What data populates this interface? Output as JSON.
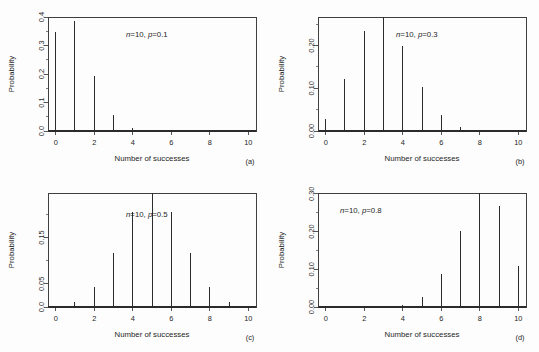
{
  "figure": {
    "background_color": "#fdfdfd",
    "ink_color": "#2b2b2b",
    "width": 539,
    "height": 352
  },
  "chart_data": [
    {
      "type": "bar",
      "panel_label": "(a)",
      "title": "",
      "annotation": "n=10, p=0.1",
      "annotation_parts": {
        "n_label": "n",
        "n_value": "=10,",
        "p_label": "p",
        "p_value": "=0.1"
      },
      "xlabel": "Number of successes",
      "ylabel": "Probability",
      "categories": [
        0,
        1,
        2,
        3,
        4,
        5,
        6,
        7,
        8,
        9,
        10
      ],
      "values": [
        0.3487,
        0.3874,
        0.1937,
        0.0574,
        0.0112,
        0.0015,
        0.0001,
        0.0,
        0.0,
        0.0,
        0.0
      ],
      "xlim": [
        -0.4,
        10.4
      ],
      "ylim": [
        0,
        0.4
      ],
      "xticks": [
        0,
        2,
        4,
        6,
        8,
        10
      ],
      "xticklabels": [
        "0",
        "2",
        "4",
        "6",
        "8",
        "10"
      ],
      "yticks": [
        0.0,
        0.1,
        0.2,
        0.3,
        0.4
      ],
      "yticklabels": [
        "0.0",
        "0.1",
        "0.2",
        "0.3",
        "0.4"
      ],
      "yminorticks": [
        0.05,
        0.15,
        0.25,
        0.35
      ],
      "grid": false,
      "legend": "none"
    },
    {
      "type": "bar",
      "panel_label": "(b)",
      "title": "",
      "annotation": "n=10, p=0.3",
      "annotation_parts": {
        "n_label": "n",
        "n_value": "=10,",
        "p_label": "p",
        "p_value": "=0.3"
      },
      "xlabel": "Number of successes",
      "ylabel": "Probability",
      "categories": [
        0,
        1,
        2,
        3,
        4,
        5,
        6,
        7,
        8,
        9,
        10
      ],
      "values": [
        0.0282,
        0.1211,
        0.2335,
        0.2668,
        0.2001,
        0.1029,
        0.0368,
        0.009,
        0.0014,
        0.0001,
        0.0
      ],
      "xlim": [
        -0.4,
        10.4
      ],
      "ylim": [
        0,
        0.2668
      ],
      "xticks": [
        0,
        2,
        4,
        6,
        8,
        10
      ],
      "xticklabels": [
        "0",
        "2",
        "4",
        "6",
        "8",
        "10"
      ],
      "yticks": [
        0.0,
        0.1,
        0.2
      ],
      "yticklabels": [
        "0.00",
        "0.10",
        "0.20"
      ],
      "yminorticks": [
        0.05,
        0.15,
        0.25
      ],
      "grid": false,
      "legend": "none"
    },
    {
      "type": "bar",
      "panel_label": "(c)",
      "title": "",
      "annotation": "n=10, p=0.5",
      "annotation_parts": {
        "n_label": "n",
        "n_value": "=10,",
        "p_label": "p",
        "p_value": "=0.5"
      },
      "xlabel": "Number of successes",
      "ylabel": "Probability",
      "categories": [
        0,
        1,
        2,
        3,
        4,
        5,
        6,
        7,
        8,
        9,
        10
      ],
      "values": [
        0.001,
        0.0098,
        0.0439,
        0.1172,
        0.2051,
        0.2461,
        0.2051,
        0.1172,
        0.0439,
        0.0098,
        0.001
      ],
      "xlim": [
        -0.4,
        10.4
      ],
      "ylim": [
        0,
        0.2461
      ],
      "xticks": [
        0,
        2,
        4,
        6,
        8,
        10
      ],
      "xticklabels": [
        "0",
        "2",
        "4",
        "6",
        "8",
        "10"
      ],
      "yticks": [
        0.0,
        0.05,
        0.15,
        0.25
      ],
      "yticklabels": [
        "0.0",
        "0.05",
        "0.15",
        "0.25"
      ],
      "yminorticks": [
        0.1,
        0.2
      ],
      "grid": false,
      "legend": "none"
    },
    {
      "type": "bar",
      "panel_label": "(d)",
      "title": "",
      "annotation": "n=10, p=0.8",
      "annotation_parts": {
        "n_label": "n",
        "n_value": "=10,",
        "p_label": "p",
        "p_value": "=0.8"
      },
      "xlabel": "Number of successes",
      "ylabel": "Probability",
      "categories": [
        0,
        1,
        2,
        3,
        4,
        5,
        6,
        7,
        8,
        9,
        10
      ],
      "values": [
        0.0,
        0.0,
        0.0001,
        0.0008,
        0.0055,
        0.0264,
        0.088,
        0.2013,
        0.302,
        0.2684,
        0.1074
      ],
      "xlim": [
        -0.4,
        10.4
      ],
      "ylim": [
        0,
        0.302
      ],
      "xticks": [
        0,
        2,
        4,
        6,
        8,
        10
      ],
      "xticklabels": [
        "0",
        "2",
        "4",
        "6",
        "8",
        "10"
      ],
      "yticks": [
        0.0,
        0.1,
        0.2,
        0.3
      ],
      "yticklabels": [
        "0.00",
        "0.10",
        "0.20",
        "0.30"
      ],
      "yminorticks": [
        0.05,
        0.15,
        0.25
      ],
      "grid": false,
      "legend": "none"
    }
  ]
}
